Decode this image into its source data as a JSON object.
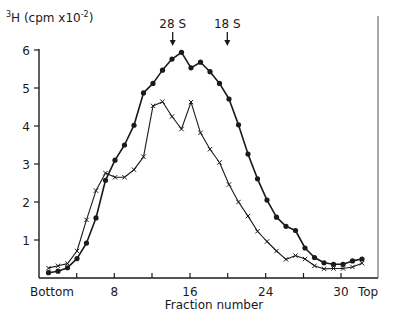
{
  "chart_data": {
    "type": "line",
    "title": "",
    "ylabel": "³H (cpm x10⁻²)",
    "ylabel_base": "H (cpm x10",
    "ylabel_sup_pre": "3",
    "ylabel_sup_exp": "-2",
    "ylabel_close": ")",
    "xlabel": "Fraction number",
    "ylim": [
      0,
      6
    ],
    "yticks": [
      1,
      2,
      3,
      4,
      5,
      6
    ],
    "xticks": [
      {
        "label": "Bottom",
        "px": 52
      },
      {
        "label": "",
        "px": 76.7
      },
      {
        "label": "8",
        "px": 114.3
      },
      {
        "label": "",
        "px": 152
      },
      {
        "label": "16",
        "px": 190
      },
      {
        "label": "",
        "px": 227.7
      },
      {
        "label": "24",
        "px": 265.7
      },
      {
        "label": "",
        "px": 303.5
      },
      {
        "label": "30",
        "px": 341
      },
      {
        "label": "Top",
        "px": 368
      }
    ],
    "grid": false,
    "legend": null,
    "annotations": [
      {
        "text": "28 S",
        "x_px": 172.7,
        "marker": "down-arrow"
      },
      {
        "text": "18 S",
        "x_px": 227.3,
        "marker": "down-arrow"
      }
    ],
    "x": [
      1,
      2,
      3,
      4,
      5,
      6,
      7,
      8,
      9,
      10,
      11,
      12,
      13,
      14,
      15,
      16,
      17,
      18,
      19,
      20,
      21,
      22,
      23,
      24,
      25,
      26,
      27,
      28,
      29,
      30,
      31,
      32,
      33,
      34
    ],
    "series": [
      {
        "name": "dots",
        "marker": "filled-circle",
        "values": [
          0.14,
          0.18,
          0.27,
          0.51,
          0.92,
          1.58,
          2.57,
          3.1,
          3.5,
          4.02,
          4.87,
          5.12,
          5.47,
          5.76,
          5.94,
          5.53,
          5.68,
          5.43,
          5.12,
          4.71,
          4.03,
          3.26,
          2.61,
          2.05,
          1.6,
          1.36,
          1.25,
          0.79,
          0.54,
          0.4,
          0.36,
          0.36,
          0.45,
          0.5
        ]
      },
      {
        "name": "crosses",
        "marker": "x",
        "values": [
          0.26,
          0.32,
          0.38,
          0.71,
          1.53,
          2.3,
          2.76,
          2.65,
          2.65,
          2.85,
          3.19,
          4.53,
          4.64,
          4.25,
          3.92,
          4.63,
          3.82,
          3.39,
          3.04,
          2.46,
          2.0,
          1.63,
          1.23,
          0.96,
          0.71,
          0.49,
          0.59,
          0.5,
          0.32,
          0.24,
          0.25,
          0.25,
          0.29,
          0.39
        ]
      }
    ]
  },
  "colors": {
    "ink": "#1a1a1a",
    "frame": "#555555",
    "background": "#ffffff"
  }
}
